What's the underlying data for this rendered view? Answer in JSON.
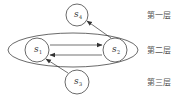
{
  "diagram": {
    "nodes": [
      {
        "id": "s4",
        "base": "s",
        "sub": "4",
        "cx": 77,
        "cy": 15,
        "r": 11
      },
      {
        "id": "s1",
        "base": "s",
        "sub": "1",
        "cx": 37,
        "cy": 50,
        "r": 12
      },
      {
        "id": "s2",
        "base": "s",
        "sub": "2",
        "cx": 115,
        "cy": 50,
        "r": 12
      },
      {
        "id": "s3",
        "base": "s",
        "sub": "3",
        "cx": 77,
        "cy": 82,
        "r": 12
      }
    ],
    "edges": [
      {
        "from": "s1",
        "to": "s2"
      },
      {
        "from": "s2",
        "to": "s1"
      },
      {
        "from": "s2",
        "to": "s4"
      },
      {
        "from": "s3",
        "to": "s1"
      }
    ],
    "group_ellipse": {
      "label": "layer-2-group",
      "members": [
        "s1",
        "s2"
      ]
    },
    "layers": [
      {
        "label": "第一层"
      },
      {
        "label": "第二层"
      },
      {
        "label": "第三层"
      }
    ]
  }
}
